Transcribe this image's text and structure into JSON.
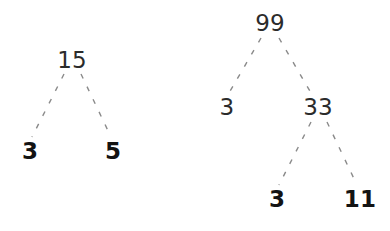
{
  "diagram": {
    "background_color": "#ffffff",
    "edge_color": "#8a8a8a",
    "composite_color": "#2b2b2b",
    "prime_color": "#131313",
    "edge_style": "dashed"
  },
  "trees": [
    {
      "name": "factor-tree-15",
      "root_value": "15",
      "nodes": [
        {
          "id": "l-root",
          "label": "15",
          "kind": "composite",
          "x": 72,
          "y": 60
        },
        {
          "id": "l-left",
          "label": "3",
          "kind": "prime",
          "x": 30,
          "y": 151
        },
        {
          "id": "l-right",
          "label": "5",
          "kind": "prime",
          "x": 113,
          "y": 151
        }
      ],
      "edges": [
        {
          "name": "edge-15-to-3",
          "from": "l-root",
          "to": "l-left",
          "x1": 64,
          "y1": 74,
          "x2": 32,
          "y2": 137
        },
        {
          "name": "edge-15-to-5",
          "from": "l-root",
          "to": "l-right",
          "x1": 81,
          "y1": 74,
          "x2": 111,
          "y2": 137
        }
      ]
    },
    {
      "name": "factor-tree-99",
      "root_value": "99",
      "nodes": [
        {
          "id": "r-root",
          "label": "99",
          "kind": "composite",
          "x": 270,
          "y": 23
        },
        {
          "id": "r-left",
          "label": "3",
          "kind": "composite",
          "x": 227,
          "y": 107
        },
        {
          "id": "r-right",
          "label": "33",
          "kind": "composite",
          "x": 318,
          "y": 107
        },
        {
          "id": "r-rightleft",
          "label": "3",
          "kind": "prime",
          "x": 277,
          "y": 199
        },
        {
          "id": "r-rightright",
          "label": "11",
          "kind": "prime",
          "x": 360,
          "y": 199
        }
      ],
      "edges": [
        {
          "name": "edge-99-to-3",
          "from": "r-root",
          "to": "r-left",
          "x1": 261,
          "y1": 38,
          "x2": 229,
          "y2": 93
        },
        {
          "name": "edge-99-to-33",
          "from": "r-root",
          "to": "r-right",
          "x1": 279,
          "y1": 38,
          "x2": 311,
          "y2": 93
        },
        {
          "name": "edge-33-to-3",
          "from": "r-right",
          "to": "r-rightleft",
          "x1": 311,
          "y1": 122,
          "x2": 279,
          "y2": 185
        },
        {
          "name": "edge-33-to-11",
          "from": "r-right",
          "to": "r-rightright",
          "x1": 327,
          "y1": 122,
          "x2": 357,
          "y2": 185
        }
      ]
    }
  ]
}
